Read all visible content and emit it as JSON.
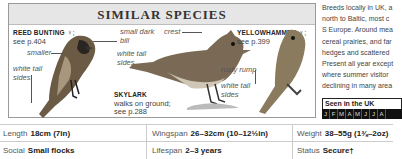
{
  "panel": {
    "title": "SIMILAR SPECIES",
    "species": [
      {
        "name": "REED BUNTING",
        "sex": "♀",
        "ref": "see p.404"
      },
      {
        "name": "SKYLARK",
        "note": "walks on ground;",
        "ref": "see p.288"
      },
      {
        "name": "YELLOWHAMMER",
        "sex": "♀",
        "ref": "see p.399"
      }
    ],
    "annotations": {
      "smaller": "smaller",
      "white_tail_sides_1a": "white tail",
      "white_tail_sides_1b": "sides",
      "small_dark_bill_a": "small dark",
      "small_dark_bill_b": "bill",
      "white_tail_sides_2a": "white tail",
      "white_tail_sides_2b": "sides",
      "crest": "crest",
      "rusty_rump": "rusty rump",
      "white_tail_sides_3a": "white tail",
      "white_tail_sides_3b": "sides"
    }
  },
  "description": {
    "lines": [
      "Breeds locally in UK, a",
      "north to Baltic, most c",
      "S Europe. Around mea",
      "cereal prairies, and far",
      "hedges and scattered",
      "Present all year except",
      "where summer visitor",
      "declining in many area"
    ]
  },
  "seen_in_uk": {
    "title": "Seen in the UK",
    "months": [
      "J",
      "F",
      "M",
      "A",
      "M",
      "J",
      "J",
      "A"
    ]
  },
  "stats": {
    "length": {
      "label": "Length",
      "value": "18cm (7in)"
    },
    "wingspan": {
      "label": "Wingspan",
      "value": "26–32cm (10–12½in)"
    },
    "weight": {
      "label": "Weight",
      "value": "38–55g (1⅜–2oz)"
    },
    "social": {
      "label": "Social",
      "value": "Small flocks"
    },
    "lifespan": {
      "label": "Lifespan",
      "value": "2–3 years"
    },
    "status": {
      "label": "Status",
      "value": "Secure†"
    }
  }
}
